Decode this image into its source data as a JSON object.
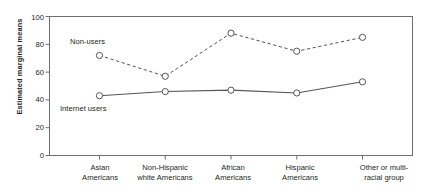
{
  "chart_data": {
    "type": "line",
    "title": "",
    "xlabel": "",
    "ylabel": "Estimated marginal means",
    "ylim": [
      0,
      100
    ],
    "yticks": [
      0,
      20,
      40,
      60,
      80,
      100
    ],
    "grid": false,
    "legend_position": "inline-annotation",
    "categories": [
      "Asian Americans",
      "Non-Hispanic white Americans",
      "African Americans",
      "Hispanic Americans",
      "Other or multi-racial group"
    ],
    "category_lines": [
      [
        "Asian",
        "Americans"
      ],
      [
        "Non-Hispanic",
        "white Americans"
      ],
      [
        "African",
        "Americans"
      ],
      [
        "Hispanic",
        "Americans"
      ],
      [
        "Other or multi-",
        "racial group"
      ]
    ],
    "series": [
      {
        "name": "Non-users",
        "values": [
          72,
          57,
          88,
          75,
          85
        ],
        "style": "dashed",
        "marker": "open-circle",
        "color": "#555555"
      },
      {
        "name": "Internet users",
        "values": [
          43,
          46,
          47,
          45,
          53
        ],
        "style": "solid",
        "marker": "open-circle",
        "color": "#555555"
      }
    ],
    "annotations": [
      {
        "text": "Non-users",
        "series": "Non-users"
      },
      {
        "text": "Internet users",
        "series": "Internet users"
      }
    ]
  },
  "axis": {
    "y_title": "Estimated marginal means",
    "y_tick_labels": [
      "100",
      "80",
      "60",
      "40",
      "20",
      "0"
    ]
  },
  "colors": {
    "frame": "#6d6e71",
    "line": "#58595b",
    "text": "#231f20",
    "background": "#ffffff"
  }
}
